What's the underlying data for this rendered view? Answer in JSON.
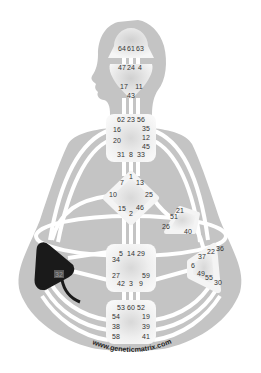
{
  "diagram": {
    "type": "human-design-bodygraph",
    "watermark": "www.geneticmatrix.com",
    "colors": {
      "background": "#ffffff",
      "body_silhouette": "#c4c4c4",
      "channel": "#ffffff",
      "center_undefined": "#f2f2f2",
      "center_defined": "#1a1a1a",
      "gate_text": "#333333"
    },
    "centers": [
      {
        "name": "Head",
        "defined": false,
        "gates": [
          "64",
          "61",
          "63"
        ]
      },
      {
        "name": "Ajna",
        "defined": false,
        "gates": [
          "47",
          "24",
          "4",
          "17",
          "11",
          "43"
        ]
      },
      {
        "name": "Throat",
        "defined": false,
        "gates": [
          "62",
          "23",
          "56",
          "16",
          "35",
          "20",
          "12",
          "45",
          "31",
          "8",
          "33"
        ]
      },
      {
        "name": "G",
        "defined": false,
        "gates": [
          "1",
          "7",
          "13",
          "10",
          "25",
          "15",
          "2",
          "46"
        ]
      },
      {
        "name": "Heart",
        "defined": false,
        "gates": [
          "21",
          "51",
          "26",
          "40"
        ]
      },
      {
        "name": "Solar Plexus",
        "defined": false,
        "gates": [
          "36",
          "22",
          "37",
          "6",
          "49",
          "55",
          "30"
        ]
      },
      {
        "name": "Sacral",
        "defined": false,
        "gates": [
          "5",
          "14",
          "29",
          "34",
          "27",
          "59",
          "42",
          "3",
          "9"
        ]
      },
      {
        "name": "Spleen",
        "defined": true,
        "gates": [
          "32"
        ]
      },
      {
        "name": "Root",
        "defined": false,
        "gates": [
          "53",
          "60",
          "52",
          "54",
          "19",
          "38",
          "39",
          "58",
          "41"
        ]
      }
    ],
    "labels": {
      "head": {
        "g64": "64",
        "g61": "61",
        "g63": "63"
      },
      "ajna": {
        "g47": "47",
        "g24": "24",
        "g4": "4",
        "g17": "17",
        "g11": "11",
        "g43": "43"
      },
      "throat": {
        "g62": "62",
        "g23": "23",
        "g56": "56",
        "g16": "16",
        "g35": "35",
        "g20": "20",
        "g12": "12",
        "g45": "45",
        "g31": "31",
        "g8": "8",
        "g33": "33"
      },
      "g": {
        "g1": "1",
        "g7": "7",
        "g13": "13",
        "g10": "10",
        "g25": "25",
        "g15": "15",
        "g2": "2",
        "g46": "46"
      },
      "heart": {
        "g21": "21",
        "g51": "51",
        "g26": "26",
        "g40": "40"
      },
      "solar": {
        "g36": "36",
        "g22": "22",
        "g37": "37",
        "g6": "6",
        "g49": "49",
        "g55": "55",
        "g30": "30"
      },
      "sacral": {
        "g5": "5",
        "g14": "14",
        "g29": "29",
        "g34": "34",
        "g27": "27",
        "g59": "59",
        "g42": "42",
        "g3": "3",
        "g9": "9"
      },
      "spleen": {
        "g32": "32"
      },
      "root": {
        "g53": "53",
        "g60": "60",
        "g52": "52",
        "g54": "54",
        "g19": "19",
        "g38": "38",
        "g39": "39",
        "g58": "58",
        "g41": "41"
      }
    },
    "defined_channels": [
      {
        "from_gate": "32",
        "to_gate": "54",
        "type": "hanging-gate-line"
      }
    ]
  }
}
